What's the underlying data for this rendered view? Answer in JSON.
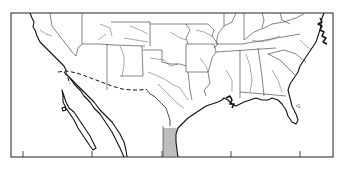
{
  "map": {
    "type": "outline map",
    "region": "Southern United States and northern Mexico",
    "style": "black line drawing on white",
    "colors": {
      "background": "#ffffff",
      "lines": "#111111"
    },
    "frame": {
      "x": 11,
      "y": 13,
      "width": 322,
      "height": 144
    },
    "bottom_ticks_x": [
      23,
      92,
      162,
      231,
      300
    ],
    "features": [
      {
        "name": "us-mexico-border",
        "style": "dashed"
      },
      {
        "name": "state-boundaries",
        "style": "thin solid"
      },
      {
        "name": "rivers",
        "style": "thin solid"
      },
      {
        "name": "coastline",
        "style": "solid"
      },
      {
        "name": "hatched-coastal-zone",
        "location": "western Gulf coast (Texas / Tamaulipas)",
        "style": "horizontal hatching"
      }
    ],
    "labels": []
  }
}
